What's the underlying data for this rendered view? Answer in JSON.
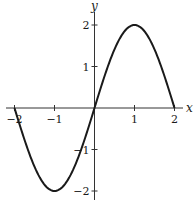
{
  "chart_data": {
    "type": "line",
    "title": "",
    "xlabel": "x",
    "ylabel": "y",
    "xlim": [
      -2.2,
      2.2
    ],
    "ylim": [
      -2.2,
      2.2
    ],
    "grid": false,
    "legend": null,
    "x_ticks": [
      -2,
      -1,
      1,
      2
    ],
    "x_tick_labels": [
      "−2",
      "−1",
      "1",
      "2"
    ],
    "y_ticks": [
      -2,
      -1,
      1,
      2
    ],
    "y_tick_labels": [
      "−2",
      "−1",
      "1",
      "2"
    ],
    "series": [
      {
        "name": "y = 2 sin(πx/2)",
        "x": [
          -2,
          -1.5,
          -1,
          -0.5,
          0,
          0.5,
          1,
          1.5,
          2
        ],
        "y": [
          0,
          -1.414,
          -2,
          -1.414,
          0,
          1.414,
          2,
          1.414,
          0
        ]
      }
    ],
    "annotations": []
  }
}
